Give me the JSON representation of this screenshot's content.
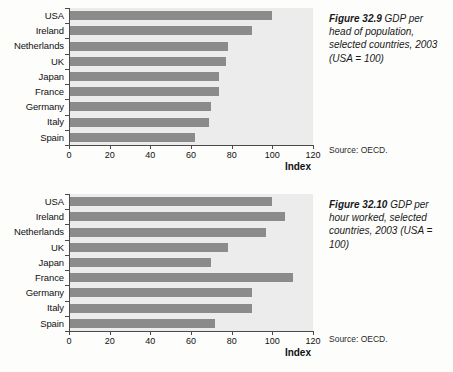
{
  "figures": [
    {
      "id": "figure-1",
      "caption_number": "Figure 32.9",
      "caption_text": "GDP per head of population, selected countries, 2003 (USA = 100)",
      "source": "Source: OECD.",
      "axis_title": "Index",
      "chart_data": {
        "type": "bar",
        "orientation": "horizontal",
        "title": "Figure 32.9 GDP per head of population, selected countries, 2003 (USA = 100)",
        "xlabel": "Index",
        "ylabel": "",
        "xlim": [
          0,
          120
        ],
        "xticks": [
          0,
          20,
          40,
          60,
          80,
          100,
          120
        ],
        "grid": false,
        "legend": "none",
        "categories": [
          "USA",
          "Ireland",
          "Netherlands",
          "UK",
          "Japan",
          "France",
          "Germany",
          "Italy",
          "Spain"
        ],
        "values": [
          100,
          90,
          78,
          77,
          74,
          74,
          70,
          69,
          62
        ],
        "bar_color": "#8b8b8b",
        "plot_background": "#ececec"
      }
    },
    {
      "id": "figure-2",
      "caption_number": "Figure 32.10",
      "caption_text": "GDP per hour worked, selected countries, 2003 (USA = 100)",
      "source": "Source: OECD.",
      "axis_title": "Index",
      "chart_data": {
        "type": "bar",
        "orientation": "horizontal",
        "title": "Figure 32.10 GDP per hour worked, selected countries, 2003 (USA = 100)",
        "xlabel": "Index",
        "ylabel": "",
        "xlim": [
          0,
          120
        ],
        "xticks": [
          0,
          20,
          40,
          60,
          80,
          100,
          120
        ],
        "grid": false,
        "legend": "none",
        "categories": [
          "USA",
          "Ireland",
          "Netherlands",
          "UK",
          "Japan",
          "France",
          "Germany",
          "Italy",
          "Spain"
        ],
        "values": [
          100,
          106,
          97,
          78,
          70,
          110,
          90,
          90,
          72
        ],
        "bar_color": "#8b8b8b",
        "plot_background": "#ececec"
      }
    }
  ]
}
